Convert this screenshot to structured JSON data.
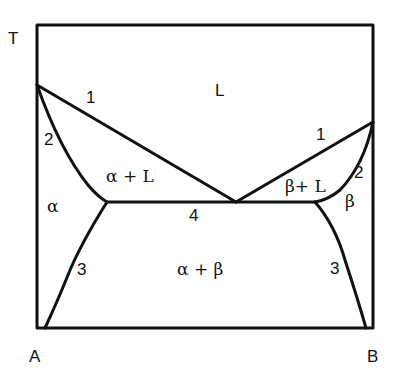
{
  "diagram": {
    "type": "binary eutectic phase diagram",
    "axis": {
      "y_label": "T",
      "x_left_label": "A",
      "x_right_label": "B"
    },
    "regions": {
      "liquid": "L",
      "alpha_liquid": "α + L",
      "beta_liquid": "β+ L",
      "alpha": "α",
      "beta": "β",
      "alpha_beta": "α + β"
    },
    "curve_labels": {
      "liquidus_left": "1",
      "liquidus_right": "1",
      "solidus_left": "2",
      "solidus_right": "2",
      "solvus_left": "3",
      "solvus_right": "3",
      "eutectic_line": "4"
    },
    "colors": {
      "line": "#111111",
      "background": "#ffffff"
    }
  }
}
